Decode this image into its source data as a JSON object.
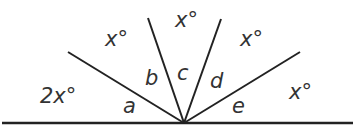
{
  "diagram": {
    "labels": {
      "two_x": "2x°",
      "x1": "x°",
      "x2": "x°",
      "x3": "x°",
      "x4": "x°",
      "a": "a",
      "b": "b",
      "c": "c",
      "d": "d",
      "e": "e"
    },
    "line_color": "#222222"
  }
}
